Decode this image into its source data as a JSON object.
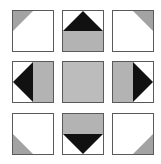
{
  "figure": {
    "colors": {
      "background": "#ffffff",
      "tile_fill": "#ffffff",
      "border": "#5a5a5a",
      "gray_panel": "#b3b3b3",
      "corner_gray": "#a3a3a3",
      "black": "#111111"
    },
    "grid": {
      "rows": 3,
      "cols": 3,
      "tile_size": 42,
      "col_x": [
        12,
        62,
        112
      ],
      "row_y": [
        10,
        61,
        113
      ]
    },
    "tiles": [
      {
        "row": 0,
        "col": 0,
        "name": "corner-top-left",
        "motif": "small gray triangle in top-left corner"
      },
      {
        "row": 0,
        "col": 1,
        "name": "edge-top",
        "motif": "black triangle pointing up over gray bottom half"
      },
      {
        "row": 0,
        "col": 2,
        "name": "corner-top-right",
        "motif": "small gray triangle in top-right corner"
      },
      {
        "row": 1,
        "col": 0,
        "name": "edge-left",
        "motif": "black triangle pointing left with gray right half"
      },
      {
        "row": 1,
        "col": 1,
        "name": "center",
        "motif": "solid gray square"
      },
      {
        "row": 1,
        "col": 2,
        "name": "edge-right",
        "motif": "black triangle pointing right with gray left half"
      },
      {
        "row": 2,
        "col": 0,
        "name": "corner-bottom-left",
        "motif": "small gray triangle in bottom-left corner"
      },
      {
        "row": 2,
        "col": 1,
        "name": "edge-bottom",
        "motif": "black triangle pointing down under gray top half"
      },
      {
        "row": 2,
        "col": 2,
        "name": "corner-bottom-right",
        "motif": "small gray triangle in bottom-right corner"
      }
    ]
  }
}
